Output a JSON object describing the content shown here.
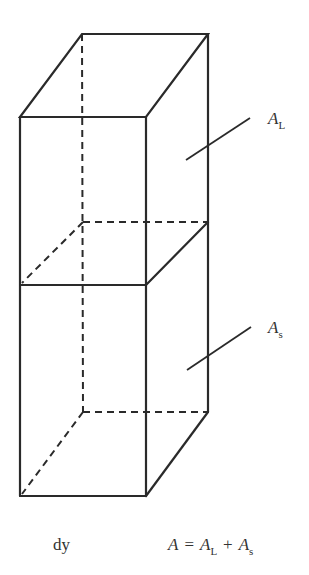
{
  "figure": {
    "type": "3d-prism-schematic",
    "labels": {
      "upper_area": {
        "main": "A",
        "sub": "L"
      },
      "lower_area": {
        "main": "A",
        "sub": "s"
      },
      "height": "dy",
      "equation": {
        "lhs": "A",
        "eq": "=",
        "t1_main": "A",
        "t1_sub": "L",
        "plus": "+",
        "t2_main": "A",
        "t2_sub": "s"
      }
    },
    "colors": {
      "line": "#2a2a2a",
      "text": "#333333",
      "background": "#ffffff"
    }
  }
}
